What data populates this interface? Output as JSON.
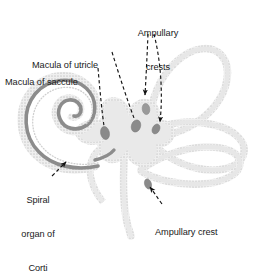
{
  "figure": {
    "background_color": "#ffffff",
    "colors": {
      "duct_fill": "#ededed",
      "duct_outline_dots": "#d0d0d0",
      "cochlear_band": "#8c8c8c",
      "sensory_patch": "#8a8a8a",
      "leader_line": "#1a1a1a",
      "text": "#1a1a1a"
    }
  },
  "labels": [
    {
      "id": "ampullary-crests",
      "text": "Ampullary\ncrests",
      "line1": "Ampullary",
      "line2": "crests",
      "align": "center",
      "points_to": [
        "superior-ampullary-crest",
        "lateral-ampullary-crest"
      ]
    },
    {
      "id": "macula-of-utricle",
      "text": "Macula of utricle",
      "line1": "Macula of utricle",
      "align": "left",
      "points_to": [
        "macula-utricle-patch"
      ]
    },
    {
      "id": "macula-of-saccule",
      "text": "Macula of saccule",
      "line1": "Macula of saccule",
      "align": "left",
      "points_to": [
        "macula-saccule-patch"
      ]
    },
    {
      "id": "spiral-organ-of-corti",
      "text": "Spiral\norgan of\nCorti",
      "line1": "Spiral",
      "line2": "organ of",
      "line3": "Corti",
      "align": "center",
      "points_to": [
        "cochlear-duct-band"
      ]
    },
    {
      "id": "ampullary-crest",
      "text": "Ampullary crest",
      "line1": "Ampullary crest",
      "align": "left",
      "points_to": [
        "posterior-ampullary-crest"
      ]
    }
  ],
  "structures": [
    {
      "id": "cochlear-duct-band",
      "name": "Spiral organ of Corti band"
    },
    {
      "id": "cochlea-spiral",
      "name": "Cochlear duct spiral"
    },
    {
      "id": "vestibule",
      "name": "Vestibule (utricle and saccule)"
    },
    {
      "id": "macula-saccule-patch",
      "name": "Macula of saccule"
    },
    {
      "id": "macula-utricle-patch",
      "name": "Macula of utricle"
    },
    {
      "id": "superior-ampullary-crest",
      "name": "Superior ampullary crest"
    },
    {
      "id": "lateral-ampullary-crest",
      "name": "Lateral ampullary crest"
    },
    {
      "id": "posterior-ampullary-crest",
      "name": "Posterior ampullary crest"
    },
    {
      "id": "superior-semicircular-canal",
      "name": "Superior semicircular canal"
    },
    {
      "id": "lateral-semicircular-canal",
      "name": "Lateral semicircular canal"
    },
    {
      "id": "posterior-semicircular-canal",
      "name": "Posterior semicircular canal"
    },
    {
      "id": "endolymphatic-duct",
      "name": "Endolymphatic duct"
    }
  ]
}
